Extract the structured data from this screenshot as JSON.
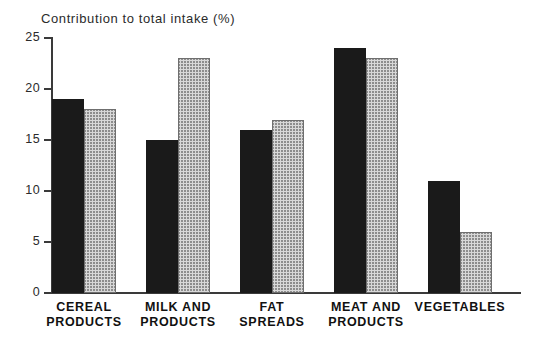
{
  "chart_data": {
    "type": "bar",
    "title": "Contribution to total intake (%)",
    "xlabel": "",
    "ylabel": "",
    "ylim": [
      0,
      25
    ],
    "yticks": [
      0,
      5,
      10,
      15,
      20,
      25
    ],
    "grid": false,
    "legend": "none",
    "categories": [
      "CEREAL PRODUCTS",
      "MILK AND PRODUCTS",
      "FAT SPREADS",
      "MEAT AND PRODUCTS",
      "VEGETABLES"
    ],
    "category_lines": [
      [
        "CEREAL",
        "PRODUCTS"
      ],
      [
        "MILK AND",
        "PRODUCTS"
      ],
      [
        "FAT",
        "SPREADS"
      ],
      [
        "MEAT AND",
        "PRODUCTS"
      ],
      [
        "VEGETABLES",
        ""
      ]
    ],
    "series": [
      {
        "name": "solid",
        "style": "solid-black",
        "color": "#1a1a1a",
        "values": [
          19,
          15,
          16,
          24,
          11
        ]
      },
      {
        "name": "hatched",
        "style": "cross-hatch-gray",
        "color": "#d8d8d8",
        "values": [
          18,
          23,
          17,
          23,
          6
        ]
      }
    ]
  }
}
